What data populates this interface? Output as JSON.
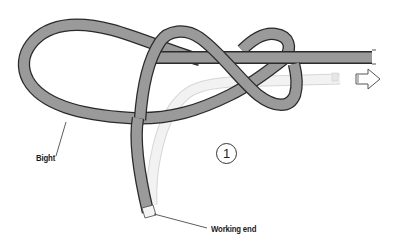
{
  "diagram": {
    "step_number": "1",
    "labels": {
      "bight": "Bight",
      "working_end": "Working end"
    },
    "colors": {
      "rope_fill": "#9a9a9a",
      "rope_outline": "#2a2a2a",
      "ghost_rope": "#eeeeee",
      "ghost_outline": "#d8d8d8",
      "background": "#ffffff",
      "text": "#1a1a1a"
    },
    "icons": {
      "direction_arrow": "arrow-right-outline"
    }
  }
}
